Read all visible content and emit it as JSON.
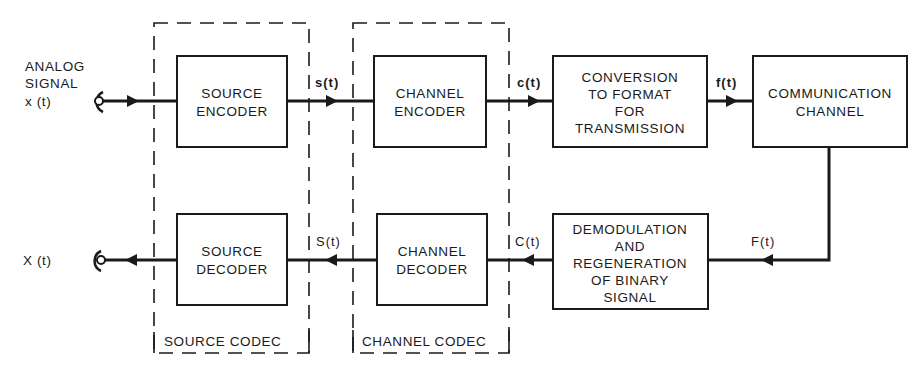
{
  "diagram": {
    "type": "block-diagram",
    "input": {
      "label_lines": [
        "ANALOG",
        "SIGNAL",
        "x (t)"
      ]
    },
    "output": {
      "label": "X (t)"
    },
    "blocks": {
      "source_encoder": [
        "SOURCE",
        "ENCODER"
      ],
      "channel_encoder": [
        "CHANNEL",
        "ENCODER"
      ],
      "conversion": [
        "CONVERSION",
        "TO FORMAT",
        "FOR",
        "TRANSMISSION"
      ],
      "communication_channel": [
        "COMMUNICATION",
        "CHANNEL"
      ],
      "source_decoder": [
        "SOURCE",
        "DECODER"
      ],
      "channel_decoder": [
        "CHANNEL",
        "DECODER"
      ],
      "demodulation": [
        "DEMODULATION",
        "AND",
        "REGENERATION",
        "OF BINARY",
        "SIGNAL"
      ]
    },
    "signals": {
      "s_lower": "s(t)",
      "c_lower": "c(t)",
      "f_lower": "f(t)",
      "F_upper": "F(t)",
      "C_upper": "C(t)",
      "S_upper": "S(t)"
    },
    "groups": {
      "source_codec": "SOURCE CODEC",
      "channel_codec": "CHANNEL CODEC"
    },
    "edges": [
      {
        "from": "input",
        "to": "source_encoder"
      },
      {
        "from": "source_encoder",
        "to": "channel_encoder",
        "label": "s(t)"
      },
      {
        "from": "channel_encoder",
        "to": "conversion",
        "label": "c(t)"
      },
      {
        "from": "conversion",
        "to": "communication_channel",
        "label": "f(t)"
      },
      {
        "from": "communication_channel",
        "to": "demodulation",
        "label": "F(t)"
      },
      {
        "from": "demodulation",
        "to": "channel_decoder",
        "label": "C(t)"
      },
      {
        "from": "channel_decoder",
        "to": "source_decoder",
        "label": "S(t)"
      },
      {
        "from": "source_decoder",
        "to": "output"
      }
    ]
  }
}
